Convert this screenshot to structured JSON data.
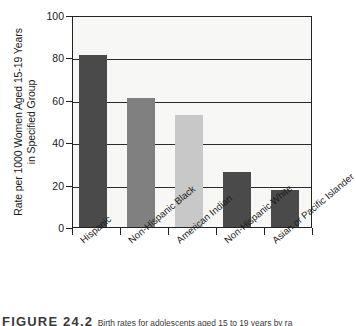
{
  "chart_data": {
    "type": "bar",
    "title": "",
    "xlabel": "",
    "ylabel": "Rate per 1000 Women Aged 15-19 Years in Specified Group",
    "ylabel_line1": "Rate per 1000 Women Aged 15-19 Years",
    "ylabel_line2": "in Specified Group",
    "categories": [
      "Hispanic",
      "Non-Hispanic Black",
      "American Indian",
      "Non-Hispanic White",
      "Asian or Pacific Islander"
    ],
    "values": [
      81,
      61,
      53,
      26,
      17.5
    ],
    "ylim": [
      0,
      100
    ],
    "yticks": [
      0,
      20,
      40,
      60,
      80,
      100
    ],
    "ytick_labels": [
      "0",
      "20",
      "40",
      "60",
      "80",
      "100"
    ],
    "grid": "horizontal",
    "legend": "none",
    "bar_colors": [
      "#4a4a4a",
      "#808080",
      "#c8c8c8",
      "#4a4a4a",
      "#4a4a4a"
    ],
    "plot_background": "#f7f7f5",
    "axis_color": "#222222"
  },
  "caption": {
    "figure_number": "FIGURE 24.2",
    "text": "Birth rates for adolescents aged 15 to 19 years by ra"
  }
}
